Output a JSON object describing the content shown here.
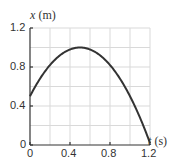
{
  "chart_data": {
    "type": "line",
    "title": "",
    "xlabel": "t (s)",
    "ylabel": "x (m)",
    "xlim": [
      0,
      1.2
    ],
    "ylim": [
      0,
      1.2
    ],
    "grid": true,
    "grid_step_x": 0.2,
    "grid_step_y": 0.2,
    "xticks": [
      "0",
      "0.4",
      "0.8",
      "1.2"
    ],
    "yticks": [
      "0",
      "0.4",
      "0.8",
      "1.2"
    ],
    "series": [
      {
        "name": "x(t)",
        "x": [
          0,
          0.1,
          0.2,
          0.3,
          0.4,
          0.5,
          0.6,
          0.7,
          0.8,
          0.9,
          1.0,
          1.1,
          1.2
        ],
        "y": [
          0.5,
          0.68,
          0.82,
          0.92,
          0.98,
          1.0,
          0.98,
          0.92,
          0.82,
          0.68,
          0.5,
          0.28,
          0.02
        ]
      }
    ],
    "colors": {
      "curve": "#333333",
      "grid": "#d9d9d9",
      "axis": "#333333"
    }
  },
  "axes": {
    "y_label_var": "x",
    "y_label_unit": "(m)",
    "x_label_var": "t",
    "x_label_unit": "(s)",
    "y_ticks": [
      "1.2",
      "0.8",
      "0.4",
      "0"
    ],
    "x_ticks": [
      "0",
      "0.4",
      "0.8",
      "1.2"
    ]
  }
}
